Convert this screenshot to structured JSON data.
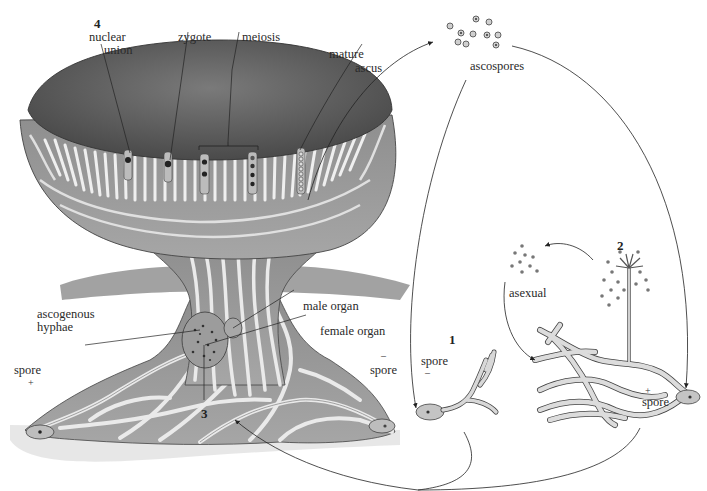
{
  "diagram": {
    "stage_numbers": [
      "1",
      "2",
      "3",
      "4"
    ],
    "labels": {
      "nuclear_union": "nuclear\nunion",
      "nuclear_union_l1": "nuclear",
      "nuclear_union_l2": "union",
      "zygote": "zygote",
      "meiosis": "meiosis",
      "mature_ascus_l1": "mature",
      "mature_ascus_l2": "ascus",
      "ascospores": "ascospores",
      "asexual": "asexual",
      "ascogenous_hyphae_l1": "ascogenous",
      "ascogenous_hyphae_l2": "hyphae",
      "male_organ": "male organ",
      "female_organ": "female organ",
      "spore_left": "spore",
      "spore_left_sign": "+",
      "spore_right_of_cup": "spore",
      "spore_right_of_cup_sign": "–",
      "spore_stage1": "spore",
      "spore_stage1_sign": "–",
      "spore_stage2": "spore",
      "spore_stage2_sign": "+"
    },
    "colors": {
      "cup_interior": "#5e5e5e",
      "tissue": "#9a9a9a",
      "hyphae": "#e6e6e6",
      "outline": "#333333",
      "arrow": "#222222",
      "background": "#ffffff"
    }
  }
}
